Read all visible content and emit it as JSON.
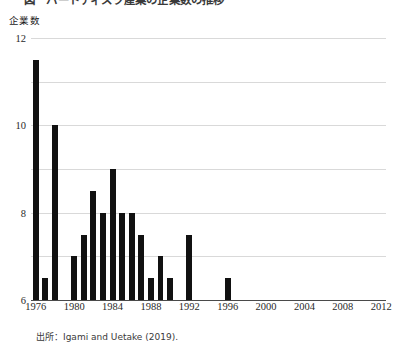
{
  "figure": {
    "caption_cutoff": "図　ハードディスク産業の企業数の推移",
    "source_note": "出所：Igami and Uetake (2019)."
  },
  "chart_data": {
    "type": "bar",
    "title": "",
    "xlabel": "",
    "ylabel": "企業数",
    "ylim": [
      0,
      12
    ],
    "yticks": [
      0,
      2,
      4,
      6,
      8,
      10,
      12
    ],
    "ytick_labels": [
      "0",
      "2",
      "4",
      "6",
      "8",
      "10",
      "12"
    ],
    "xlim": [
      1975.5,
      2012.5
    ],
    "xticks": [
      1976,
      1980,
      1984,
      1988,
      1992,
      1996,
      2000,
      2004,
      2008,
      2012
    ],
    "xtick_labels": [
      "1976",
      "1980",
      "1984",
      "1988",
      "1992",
      "1996",
      "2000",
      "2004",
      "2008",
      "2012"
    ],
    "grid": true,
    "legend": false,
    "bar_color": "#111111",
    "grid_color": "#d9d9d9",
    "categories": [
      1976,
      1977,
      1978,
      1979,
      1980,
      1981,
      1982,
      1983,
      1984,
      1985,
      1986,
      1987,
      1988,
      1989,
      1990,
      1991,
      1992,
      1993,
      1994,
      1995,
      1996,
      1997,
      1998,
      1999,
      2000,
      2001,
      2002,
      2003,
      2004,
      2005,
      2006,
      2007,
      2008,
      2009,
      2010,
      2011,
      2012
    ],
    "values": [
      11,
      1,
      8,
      0,
      2,
      3,
      5,
      4,
      6,
      4,
      4,
      3,
      1,
      2,
      1,
      0,
      3,
      0,
      0,
      0,
      1,
      0,
      0,
      0,
      0,
      0,
      0,
      0,
      0,
      0,
      0,
      0,
      0,
      0,
      0,
      0,
      0
    ]
  }
}
